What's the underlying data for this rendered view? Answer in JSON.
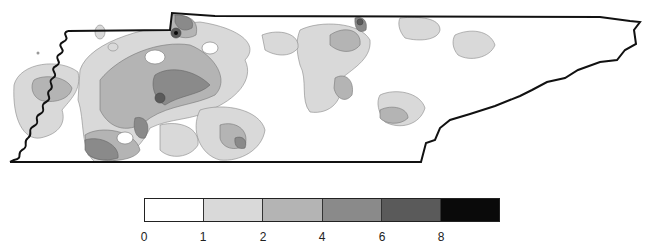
{
  "map": {
    "region": "Tennessee",
    "state_border_color": "#111111",
    "contour_line_color": "#777777"
  },
  "legend": {
    "classes": [
      {
        "from": 0,
        "to": 1,
        "color": "#ffffff"
      },
      {
        "from": 1,
        "to": 2,
        "color": "#d9d9d9"
      },
      {
        "from": 2,
        "to": 4,
        "color": "#b4b4b4"
      },
      {
        "from": 4,
        "to": 6,
        "color": "#8a8a8a"
      },
      {
        "from": 6,
        "to": 8,
        "color": "#5a5a5a"
      },
      {
        "from": 8,
        "to": null,
        "color": "#0a0a0a"
      }
    ],
    "tick_labels": [
      "0",
      "1",
      "2",
      "4",
      "6",
      "8"
    ]
  }
}
